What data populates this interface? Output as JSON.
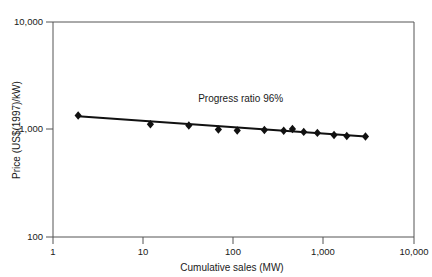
{
  "chart_data": {
    "type": "line",
    "title": "",
    "subtitle": "",
    "xlabel": "Cumulative sales (MW)",
    "ylabel": "Price (US$(1997)/kW)",
    "xscale": "log",
    "yscale": "log",
    "xlim": [
      1,
      10000
    ],
    "ylim": [
      100,
      10000
    ],
    "grid": false,
    "legend": null,
    "xticks": [
      1,
      10,
      100,
      1000,
      10000
    ],
    "xtick_labels": [
      "1",
      "10",
      "100",
      "1,000",
      "10,000"
    ],
    "yticks": [
      100,
      1000,
      10000
    ],
    "ytick_labels": [
      "100",
      "1,000",
      "10,000"
    ],
    "marker": "diamond",
    "line_color": "#111111",
    "marker_color": "#111111",
    "axis_color": "#555555",
    "annotations": [
      {
        "text": "Progress ratio 96%",
        "x": 120,
        "y": 1800
      }
    ],
    "series": [
      {
        "name": "Experience curve",
        "x": [
          1.9,
          12,
          32,
          68,
          110,
          220,
          360,
          450,
          600,
          850,
          1300,
          1800,
          2900
        ],
        "values": [
          1350,
          1120,
          1090,
          1000,
          980,
          990,
          975,
          1010,
          950,
          930,
          890,
          870,
          860
        ]
      }
    ],
    "trendline": {
      "name": "Fitted progress ratio line",
      "x": [
        1.9,
        2900
      ],
      "values": [
        1330,
        860
      ]
    }
  }
}
